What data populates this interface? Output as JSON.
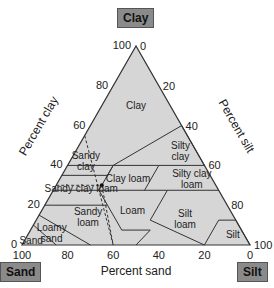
{
  "corners": {
    "clay": "Clay",
    "sand": "Sand",
    "silt": "Silt"
  },
  "axes": {
    "clay_label": "Percent clay",
    "silt_label": "Percent silt",
    "sand_label": "Percent sand",
    "clay_ticks": [
      "0",
      "20",
      "40",
      "60",
      "80",
      "100"
    ],
    "silt_ticks": [
      "0",
      "20",
      "40",
      "60",
      "80",
      "100"
    ],
    "sand_ticks": [
      "100",
      "80",
      "60",
      "40",
      "20",
      "0"
    ]
  },
  "regions": [
    {
      "name": "clay",
      "label": [
        "Clay"
      ]
    },
    {
      "name": "sandy-clay",
      "label": [
        "Sandy",
        "clay"
      ]
    },
    {
      "name": "silty-clay",
      "label": [
        "Silty",
        "clay"
      ]
    },
    {
      "name": "sandy-clay-loam",
      "label": [
        "Sandy clay loam"
      ]
    },
    {
      "name": "clay-loam",
      "label": [
        "Clay loam"
      ]
    },
    {
      "name": "silty-clay-loam",
      "label": [
        "Silty clay",
        "loam"
      ]
    },
    {
      "name": "sandy-loam",
      "label": [
        "Sandy",
        "loam"
      ]
    },
    {
      "name": "loam",
      "label": [
        "Loam"
      ]
    },
    {
      "name": "silt-loam",
      "label": [
        "Silt",
        "loam"
      ]
    },
    {
      "name": "loamy-sand",
      "label": [
        "Loamy",
        "sand"
      ]
    },
    {
      "name": "sand",
      "label": [
        "Sand"
      ]
    },
    {
      "name": "silt",
      "label": [
        "Silt"
      ]
    }
  ],
  "colors": {
    "fill": "#d6d6d6",
    "line": "#333333",
    "corner_bg": "#8a8a8a"
  }
}
